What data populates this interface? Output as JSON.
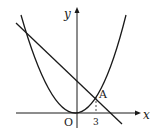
{
  "diagram": {
    "type": "coordinate-graph",
    "axes": {
      "x_label": "x",
      "y_label": "y",
      "origin_label": "O"
    },
    "curves": [
      {
        "name": "parabola",
        "description": "upward parabola with vertex at origin"
      },
      {
        "name": "line",
        "description": "decreasing line intersecting parabola"
      }
    ],
    "points": [
      {
        "label": "A",
        "x_tick": "3"
      }
    ],
    "colors": {
      "stroke": "#1a1a1a",
      "background": "#ffffff"
    }
  }
}
